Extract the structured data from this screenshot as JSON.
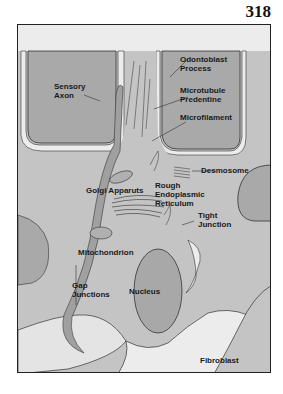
{
  "page": {
    "number": "318"
  },
  "figure": {
    "colors": {
      "background": "#ececec",
      "cell_body": "#c4c4c4",
      "dark_region": "#a9a9a9",
      "outline": "#333333",
      "frame": "#222222"
    },
    "labels": {
      "odontoblast_process": "Odontoblast\nProcess",
      "sensory_axon": "Sensory\nAxon",
      "microtubule_predentine": "Microtubule\nPredentine",
      "microfilament": "Microfilament",
      "desmosome": "Desmosome",
      "golgi_apparatus": "Golgi Apparuts",
      "rough_er": "Rough\nEndoplasmic\nReticulum",
      "tight_junction": "Tight\nJunction",
      "mitochondrion": "Mitochondrion",
      "gap_junctions": "Gap\nJunctions",
      "nucleus": "Nucleus",
      "fibroblast": "Fibroblast"
    }
  }
}
